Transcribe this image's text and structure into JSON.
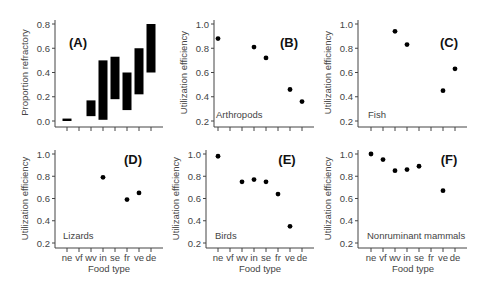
{
  "figure": {
    "xlabel": "Food type",
    "categories": [
      "ne",
      "vf",
      "wv",
      "in",
      "se",
      "fr",
      "ve",
      "de"
    ]
  },
  "chart_data": [
    {
      "panel": "(A)",
      "type": "bar",
      "title": "",
      "xlabel": "",
      "ylabel": "Proportion refractory",
      "ylim": [
        0.0,
        0.8
      ],
      "yticks": [
        "0.0",
        "0.2",
        "0.4",
        "0.6",
        "0.8"
      ],
      "categories": [
        "ne",
        "vf",
        "wv",
        "in",
        "se",
        "fr",
        "ve",
        "de"
      ],
      "ranges": [
        [
          0.0,
          0.02
        ],
        null,
        [
          0.04,
          0.17
        ],
        [
          0.01,
          0.5
        ],
        [
          0.18,
          0.53
        ],
        [
          0.09,
          0.4
        ],
        [
          0.22,
          0.6
        ],
        [
          0.4,
          0.8
        ]
      ],
      "grid": false
    },
    {
      "panel": "(B)",
      "type": "scatter",
      "group": "Arthropods",
      "xlabel": "",
      "ylabel": "Utilization efficiency",
      "ylim": [
        0.2,
        1.0
      ],
      "yticks": [
        "0.2",
        "0.4",
        "0.6",
        "0.8",
        "1.0"
      ],
      "categories": [
        "ne",
        "vf",
        "wv",
        "in",
        "se",
        "fr",
        "ve",
        "de"
      ],
      "values": [
        0.88,
        null,
        null,
        0.81,
        0.72,
        null,
        0.46,
        0.36
      ],
      "grid": false
    },
    {
      "panel": "(C)",
      "type": "scatter",
      "group": "Fish",
      "xlabel": "",
      "ylabel": "Utilization efficiency",
      "ylim": [
        0.2,
        1.0
      ],
      "yticks": [
        "0.2",
        "0.4",
        "0.6",
        "0.8",
        "1.0"
      ],
      "categories": [
        "ne",
        "vf",
        "wv",
        "in",
        "se",
        "fr",
        "ve",
        "de"
      ],
      "values": [
        null,
        null,
        0.94,
        0.83,
        null,
        null,
        0.45,
        0.63
      ],
      "grid": false
    },
    {
      "panel": "(D)",
      "type": "scatter",
      "group": "Lizards",
      "xlabel": "Food type",
      "ylabel": "Utilization efficiency",
      "ylim": [
        0.2,
        1.0
      ],
      "yticks": [
        "0.2",
        "0.4",
        "0.6",
        "0.8",
        "1.0"
      ],
      "categories": [
        "ne",
        "vf",
        "wv",
        "in",
        "se",
        "fr",
        "ve",
        "de"
      ],
      "values": [
        null,
        null,
        null,
        0.79,
        null,
        0.59,
        0.65,
        null
      ],
      "grid": false
    },
    {
      "panel": "(E)",
      "type": "scatter",
      "group": "Birds",
      "xlabel": "Food type",
      "ylabel": "Utilization efficiency",
      "ylim": [
        0.2,
        1.0
      ],
      "yticks": [
        "0.2",
        "0.4",
        "0.6",
        "0.8",
        "1.0"
      ],
      "categories": [
        "ne",
        "vf",
        "wv",
        "in",
        "se",
        "fr",
        "ve",
        "de"
      ],
      "values": [
        0.98,
        null,
        0.75,
        0.77,
        0.75,
        0.64,
        0.35,
        null
      ],
      "grid": false
    },
    {
      "panel": "(F)",
      "type": "scatter",
      "group": "Nonruminant mammals",
      "xlabel": "Food type",
      "ylabel": "Utilization efficiency",
      "ylim": [
        0.2,
        1.0
      ],
      "yticks": [
        "0.2",
        "0.4",
        "0.6",
        "0.8",
        "1.0"
      ],
      "categories": [
        "ne",
        "vf",
        "wv",
        "in",
        "se",
        "fr",
        "ve",
        "de"
      ],
      "values": [
        1.0,
        0.95,
        0.85,
        0.86,
        0.89,
        null,
        0.67,
        null
      ],
      "grid": false
    }
  ]
}
